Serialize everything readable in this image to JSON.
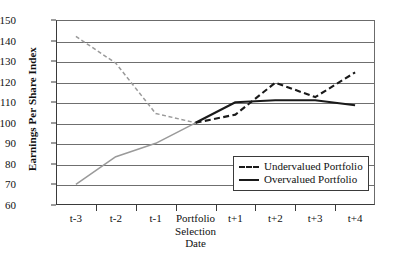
{
  "chart_data": {
    "type": "line",
    "title": "",
    "xlabel": "",
    "ylabel": "Earnings Per Share Index",
    "categories": [
      "t-3",
      "t-2",
      "t-1",
      "Portfolio Selection Date",
      "t+1",
      "t+2",
      "t+3",
      "t+4"
    ],
    "x_tick_labels": [
      [
        "t-3"
      ],
      [
        "t-2"
      ],
      [
        "t-1"
      ],
      [
        "Portfolio",
        "Selection",
        "Date"
      ],
      [
        "t+1"
      ],
      [
        "t+2"
      ],
      [
        "t+3"
      ],
      [
        "t+4"
      ]
    ],
    "ylim": [
      60,
      150
    ],
    "y_ticks": [
      150,
      140,
      130,
      120,
      110,
      100,
      90,
      80,
      70,
      60
    ],
    "grid": true,
    "legend_position": "lower-right",
    "series": [
      {
        "name": "Undervalued Portfolio",
        "style": "dashed",
        "values": [
          142,
          129,
          104.5,
          100,
          104,
          119.5,
          112.5,
          124.5
        ]
      },
      {
        "name": "Overvalued Portfolio",
        "style": "solid",
        "values": [
          70,
          83.5,
          90,
          100,
          110,
          111,
          111,
          108.5
        ]
      }
    ],
    "pre_selection_color": "#9a9a9a",
    "post_selection_color": "#1a1a1a",
    "axis_color": "#3a3a3a",
    "grid_color": "#6f6f6f"
  },
  "legend": {
    "items": [
      {
        "label": "Undervalued Portfolio",
        "style": "dashed"
      },
      {
        "label": "Overvalued Portfolio",
        "style": "solid"
      }
    ]
  }
}
